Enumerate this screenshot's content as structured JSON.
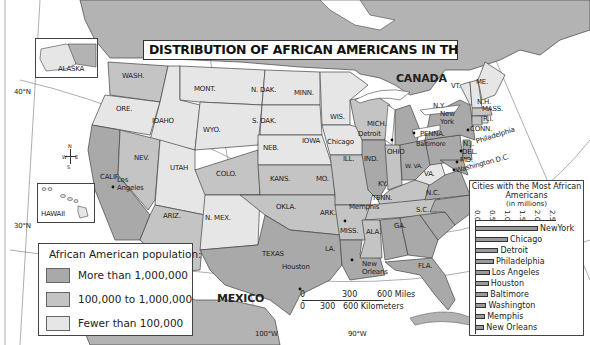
{
  "map": {
    "title": "DISTRIBUTION OF AFRICAN AMERICANS IN THE 1990s",
    "colors": {
      "high": "#a9a9a9",
      "medium": "#c4c4c4",
      "low": "#e6e6e6",
      "foreign": "#b3b3b3",
      "water": "#ffffff",
      "border": "#444444"
    },
    "countries": {
      "canada": "CANADA",
      "mexico": "MEXICO"
    },
    "insets": {
      "alaska": "ALASKA",
      "hawaii": "HAWAII"
    },
    "coordinates": {
      "lat_40": "40°N",
      "lat_30": "30°N",
      "lon_100": "100°W",
      "lon_90": "90°W"
    },
    "compass": {
      "n": "N",
      "s": "S",
      "e": "E",
      "w": "W"
    },
    "states": [
      {
        "abbr": "WASH.",
        "category": "medium"
      },
      {
        "abbr": "ORE.",
        "category": "low"
      },
      {
        "abbr": "CALIF.",
        "category": "high"
      },
      {
        "abbr": "IDAHO",
        "category": "low"
      },
      {
        "abbr": "NEV.",
        "category": "medium"
      },
      {
        "abbr": "UTAH",
        "category": "low"
      },
      {
        "abbr": "ARIZ.",
        "category": "medium"
      },
      {
        "abbr": "MONT.",
        "category": "low"
      },
      {
        "abbr": "WYO.",
        "category": "low"
      },
      {
        "abbr": "COLO.",
        "category": "medium"
      },
      {
        "abbr": "N. MEX.",
        "category": "low"
      },
      {
        "abbr": "N. DAK.",
        "category": "low"
      },
      {
        "abbr": "S. DAK.",
        "category": "low"
      },
      {
        "abbr": "NEB.",
        "category": "low"
      },
      {
        "abbr": "KANS.",
        "category": "medium"
      },
      {
        "abbr": "OKLA.",
        "category": "medium"
      },
      {
        "abbr": "TEXAS",
        "category": "high"
      },
      {
        "abbr": "MINN.",
        "category": "low"
      },
      {
        "abbr": "IOWA",
        "category": "low"
      },
      {
        "abbr": "MO.",
        "category": "medium"
      },
      {
        "abbr": "ARK.",
        "category": "medium"
      },
      {
        "abbr": "LA.",
        "category": "high"
      },
      {
        "abbr": "WIS.",
        "category": "medium"
      },
      {
        "abbr": "ILL.",
        "category": "high"
      },
      {
        "abbr": "MICH.",
        "category": "high"
      },
      {
        "abbr": "IND.",
        "category": "medium"
      },
      {
        "abbr": "OHIO",
        "category": "high"
      },
      {
        "abbr": "KY.",
        "category": "medium"
      },
      {
        "abbr": "TENN.",
        "category": "medium"
      },
      {
        "abbr": "MISS.",
        "category": "medium"
      },
      {
        "abbr": "ALA.",
        "category": "high"
      },
      {
        "abbr": "GA.",
        "category": "high"
      },
      {
        "abbr": "FLA.",
        "category": "high"
      },
      {
        "abbr": "S.C.",
        "category": "high"
      },
      {
        "abbr": "N.C.",
        "category": "high"
      },
      {
        "abbr": "VA.",
        "category": "high"
      },
      {
        "abbr": "W. VA.",
        "category": "low"
      },
      {
        "abbr": "PENNA.",
        "category": "high"
      },
      {
        "abbr": "N.Y.",
        "category": "high"
      },
      {
        "abbr": "VT.",
        "category": "low"
      },
      {
        "abbr": "N.H.",
        "category": "low"
      },
      {
        "abbr": "ME.",
        "category": "low"
      },
      {
        "abbr": "MASS.",
        "category": "medium"
      },
      {
        "abbr": "R.I.",
        "category": "low"
      },
      {
        "abbr": "CONN.",
        "category": "medium"
      },
      {
        "abbr": "N.J.",
        "category": "high"
      },
      {
        "abbr": "DEL.",
        "category": "medium"
      },
      {
        "abbr": "MD.",
        "category": "high"
      },
      {
        "abbr": "ALASKA",
        "category": "low"
      },
      {
        "abbr": "HAWAII",
        "category": "low"
      }
    ],
    "cities": {
      "los_angeles_1": "Los",
      "los_angeles_2": "Angeles",
      "houston": "Houston",
      "chicago": "Chicago",
      "detroit": "Detroit",
      "memphis": "Memphis",
      "new_orleans_1": "New",
      "new_orleans_2": "Orleans",
      "new_york_1": "New",
      "new_york_2": "York",
      "baltimore": "Baltimore",
      "philadelphia": "Philadelphia",
      "washington": "Washington D.C."
    },
    "scale_bar": {
      "miles": [
        "0",
        "300",
        "600 Miles"
      ],
      "km": [
        "0",
        "300",
        "600 Kilometers"
      ]
    }
  },
  "legend": {
    "title": "African American population:",
    "items": [
      {
        "label": "More than 1,000,000",
        "color": "#a9a9a9"
      },
      {
        "label": "100,000 to 1,000,000",
        "color": "#c4c4c4"
      },
      {
        "label": "Fewer than 100,000",
        "color": "#e6e6e6"
      }
    ]
  },
  "chart_data": {
    "type": "bar",
    "orientation": "horizontal",
    "title": "Cities with the Most African Americans",
    "subtitle": "(in millions)",
    "xlabel": "in millions",
    "ylabel": "",
    "xlim": [
      0,
      2.5
    ],
    "ticks": [
      "0.0",
      "0.5",
      "1.0",
      "1.5",
      "2.0",
      "2.5"
    ],
    "categories": [
      "NewYork",
      "Chicago",
      "Detroit",
      "Philadelphia",
      "Los Angeles",
      "Houston",
      "Baltimore",
      "Washington",
      "Memphis",
      "New Orleans"
    ],
    "values": [
      2.1,
      1.1,
      0.78,
      0.63,
      0.49,
      0.46,
      0.44,
      0.38,
      0.34,
      0.31
    ],
    "legend": "none",
    "grid": false
  }
}
